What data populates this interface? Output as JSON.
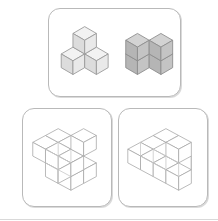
{
  "figure": {
    "kind": "isometric-cube-assembly-puzzle",
    "panel_count": 3,
    "background_color": "#ffffff",
    "panel_border_color": "#b9b9b9",
    "edge_color": "#8d8d8d",
    "wire_edge_color": "#a7a7a7"
  },
  "panels": [
    {
      "id": "panel-top",
      "name": "prompt-panel",
      "position": "top-center",
      "shapes": [
        {
          "id": "shape-light-tripod",
          "name": "light-three-cube-group",
          "cube_count": 3,
          "fill_style": "light-gray-shaded",
          "arrangement": "one cube on top center, two cubes below left and right",
          "colors": {
            "top_face": "#f2f2f2",
            "left_face": "#dcdcdc",
            "right_face": "#e9e9e9"
          }
        },
        {
          "id": "shape-dark-block",
          "name": "dark-four-cube-block",
          "cube_count": 4,
          "fill_style": "medium-gray-shaded",
          "arrangement": "two-by-two upright block, two cubes wide and two cubes tall",
          "colors": {
            "top_face": "#d3d3d3",
            "left_face": "#b5b5b5",
            "right_face": "#c4c4c4"
          }
        }
      ]
    },
    {
      "id": "panel-bottom-l",
      "name": "answer-option-left",
      "position": "bottom-left",
      "shapes": [
        {
          "id": "shape-wire-l",
          "name": "white-wireframe-assembly-left",
          "cube_count": 7,
          "fill_style": "white-outline",
          "arrangement": "L-shaped slab of cubes with a raised cube at the right end",
          "colors": {
            "top_face": "#ffffff",
            "left_face": "#ffffff",
            "right_face": "#ffffff"
          }
        }
      ]
    },
    {
      "id": "panel-bottom-r",
      "name": "answer-option-right",
      "position": "bottom-right",
      "shapes": [
        {
          "id": "shape-wire-r",
          "name": "white-wireframe-assembly-right",
          "cube_count": 7,
          "fill_style": "white-outline",
          "arrangement": "row of cubes with a second row stepped up behind at the right",
          "colors": {
            "top_face": "#ffffff",
            "left_face": "#ffffff",
            "right_face": "#ffffff"
          }
        }
      ]
    }
  ]
}
